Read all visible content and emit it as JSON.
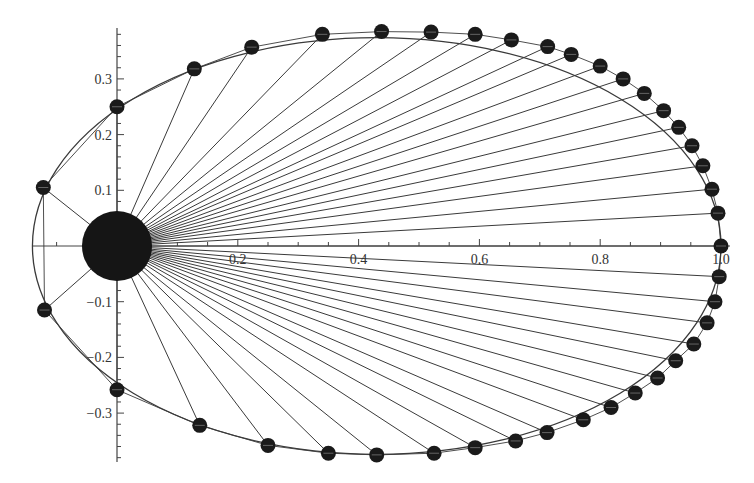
{
  "chart_data": {
    "type": "scatter",
    "title": "",
    "subtitle": "",
    "xlabel": "",
    "ylabel": "",
    "xlim": [
      -0.14,
      1.0
    ],
    "ylim": [
      -0.38,
      0.39
    ],
    "grid": false,
    "legend": null,
    "x_ticks": [
      0.2,
      0.4,
      0.6,
      0.8,
      1.0
    ],
    "x_tick_labels": [
      "0.2",
      "0.4",
      "0.6",
      "0.8",
      "1.0"
    ],
    "y_ticks": [
      -0.3,
      -0.2,
      -0.1,
      0.1,
      0.2,
      0.3
    ],
    "y_tick_labels": [
      "-0.3",
      "-0.2",
      "-0.1",
      "0.1",
      "0.2",
      "0.3"
    ],
    "ellipse": {
      "center_x": 0.43,
      "center_y": 0.0,
      "semi_major": 0.57,
      "semi_minor": 0.374,
      "focus": [
        0.0,
        0.0
      ],
      "eccentricity": 0.754
    },
    "central_body": {
      "x": 0.0,
      "y": 0.0,
      "radius": 0.058
    },
    "planet_count": 40,
    "points": [
      {
        "x": 1.0,
        "y": 0.0
      },
      {
        "x": 0.995,
        "y": 0.059
      },
      {
        "x": 0.985,
        "y": 0.102
      },
      {
        "x": 0.97,
        "y": 0.144
      },
      {
        "x": 0.952,
        "y": 0.18
      },
      {
        "x": 0.93,
        "y": 0.213
      },
      {
        "x": 0.905,
        "y": 0.243
      },
      {
        "x": 0.873,
        "y": 0.274
      },
      {
        "x": 0.838,
        "y": 0.3
      },
      {
        "x": 0.8,
        "y": 0.323
      },
      {
        "x": 0.752,
        "y": 0.344
      },
      {
        "x": 0.713,
        "y": 0.358
      },
      {
        "x": 0.653,
        "y": 0.37
      },
      {
        "x": 0.593,
        "y": 0.38
      },
      {
        "x": 0.52,
        "y": 0.384
      },
      {
        "x": 0.438,
        "y": 0.385
      },
      {
        "x": 0.34,
        "y": 0.38
      },
      {
        "x": 0.223,
        "y": 0.357
      },
      {
        "x": 0.128,
        "y": 0.318
      },
      {
        "x": 0.0,
        "y": 0.25
      },
      {
        "x": -0.122,
        "y": 0.105
      },
      {
        "x": -0.12,
        "y": -0.115
      },
      {
        "x": 0.0,
        "y": -0.258
      },
      {
        "x": 0.137,
        "y": -0.322
      },
      {
        "x": 0.25,
        "y": -0.358
      },
      {
        "x": 0.35,
        "y": -0.372
      },
      {
        "x": 0.43,
        "y": -0.375
      },
      {
        "x": 0.525,
        "y": -0.372
      },
      {
        "x": 0.593,
        "y": -0.362
      },
      {
        "x": 0.66,
        "y": -0.35
      },
      {
        "x": 0.712,
        "y": -0.335
      },
      {
        "x": 0.772,
        "y": -0.312
      },
      {
        "x": 0.818,
        "y": -0.29
      },
      {
        "x": 0.858,
        "y": -0.264
      },
      {
        "x": 0.895,
        "y": -0.237
      },
      {
        "x": 0.925,
        "y": -0.206
      },
      {
        "x": 0.955,
        "y": -0.176
      },
      {
        "x": 0.977,
        "y": -0.138
      },
      {
        "x": 0.99,
        "y": -0.1
      },
      {
        "x": 0.997,
        "y": -0.055
      }
    ]
  },
  "colors": {
    "background": "#ffffff",
    "lines": "#3a3a3a",
    "points": "#1a1a1a",
    "central_body": "#151515",
    "axis": "#444444",
    "tick_label": "#333333"
  },
  "axes": {
    "origin_px": [
      117,
      246
    ],
    "px_per_unit_x": 604,
    "px_per_unit_y": 557,
    "y_axis_top_px": 28,
    "y_axis_bottom_px": 462,
    "x_axis_left_px": 33,
    "x_axis_right_px": 730
  }
}
